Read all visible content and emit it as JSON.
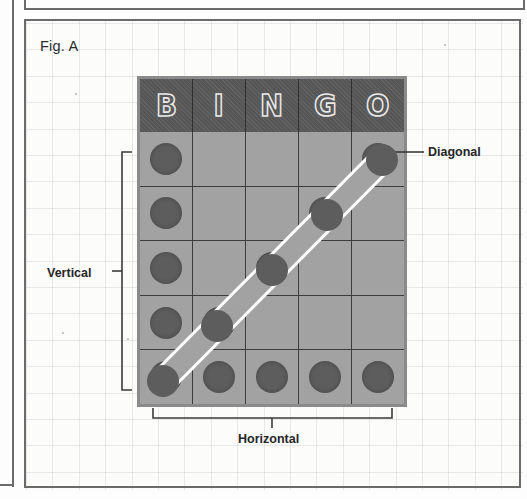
{
  "figure": {
    "label": "Fig. A",
    "caption_present": true
  },
  "card": {
    "columns": [
      "B",
      "I",
      "N",
      "G",
      "O"
    ],
    "rows": 5,
    "cells": [
      [
        true,
        false,
        false,
        false,
        true
      ],
      [
        true,
        false,
        false,
        true,
        false
      ],
      [
        true,
        false,
        true,
        false,
        false
      ],
      [
        true,
        true,
        false,
        false,
        false
      ],
      [
        true,
        true,
        true,
        true,
        true
      ]
    ]
  },
  "annotations": {
    "diagonal": {
      "label": "Diagonal",
      "from_cell": "row5-col1",
      "to_cell": "row1-col5"
    },
    "vertical": {
      "label": "Vertical",
      "spans": "rows 1-5 of column B"
    },
    "horizontal": {
      "label": "Horizontal",
      "spans": "columns B through O of row 5"
    }
  },
  "colors": {
    "header_bg": "#565656",
    "cell_bg": "#a2a2a2",
    "chip": "#5d5d5d",
    "marker_line": "#ffffff",
    "border": "#6b6b6b",
    "paper": "#fcfcfb",
    "text": "#262626"
  }
}
